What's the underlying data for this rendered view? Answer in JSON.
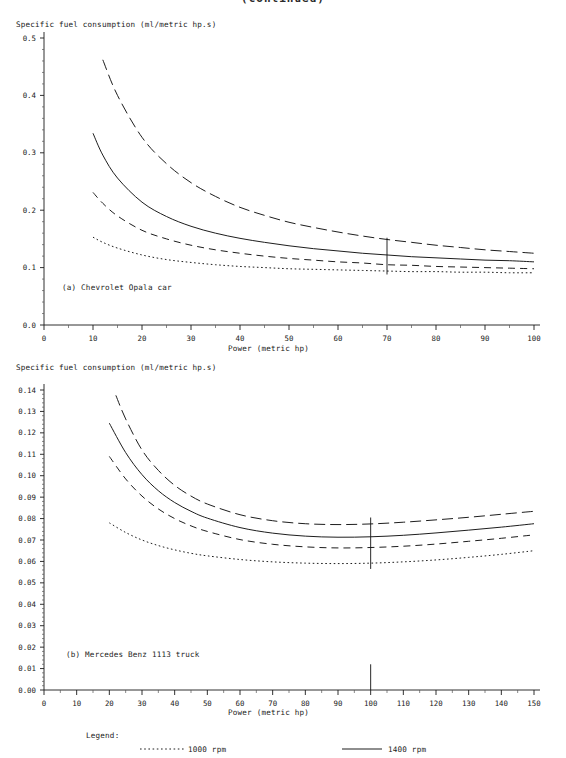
{
  "figure": {
    "top_title_clipped": "(continued)",
    "y_axis_title": "Specific fuel consumption (ml/metric hp.s)",
    "x_axis_title": "Power (metric hp)"
  },
  "legend": {
    "title": "Legend:",
    "entries": [
      {
        "label": "1000 rpm",
        "style": "dotted"
      },
      {
        "label": "1400 rpm",
        "style": "solid"
      }
    ]
  },
  "chart_data": [
    {
      "type": "line",
      "title": "(a) Chevrolet Opala car",
      "xlabel": "Power (metric hp)",
      "ylabel": "Specific fuel consumption (ml/metric hp.s)",
      "xlim": [
        0,
        100
      ],
      "ylim": [
        0.0,
        0.5
      ],
      "xticks": [
        0,
        10,
        20,
        30,
        40,
        50,
        60,
        70,
        80,
        90,
        100
      ],
      "yticks": [
        0.0,
        0.1,
        0.2,
        0.3,
        0.4,
        0.5
      ],
      "xtick_labels": [
        "0",
        "10",
        "20",
        "30",
        "40",
        "50",
        "60",
        "70",
        "80",
        "90",
        "100"
      ],
      "ytick_labels": [
        "0.0",
        "0.1",
        "0.2",
        "0.3",
        "0.4",
        "0.5"
      ],
      "minor_ticks": true,
      "grid": false,
      "legend_position": "below-figure",
      "marker_line_x": 70,
      "series": [
        {
          "name": "2400 rpm",
          "style": "long-dash",
          "x": [
            12,
            15,
            20,
            25,
            30,
            35,
            40,
            45,
            50,
            55,
            60,
            65,
            70,
            75,
            80,
            85,
            90,
            95,
            100
          ],
          "y": [
            0.462,
            0.4,
            0.327,
            0.281,
            0.248,
            0.224,
            0.205,
            0.191,
            0.179,
            0.17,
            0.162,
            0.155,
            0.149,
            0.144,
            0.139,
            0.135,
            0.131,
            0.128,
            0.125
          ]
        },
        {
          "name": "1400 rpm",
          "style": "solid",
          "x": [
            10,
            12,
            15,
            20,
            25,
            30,
            35,
            40,
            45,
            50,
            55,
            60,
            65,
            70,
            75,
            80,
            85,
            90,
            95,
            100
          ],
          "y": [
            0.334,
            0.296,
            0.256,
            0.214,
            0.189,
            0.172,
            0.16,
            0.151,
            0.144,
            0.138,
            0.133,
            0.129,
            0.125,
            0.122,
            0.119,
            0.117,
            0.115,
            0.113,
            0.112,
            0.11
          ]
        },
        {
          "name": "1800 rpm",
          "style": "medium-dash",
          "x": [
            10,
            12,
            15,
            20,
            25,
            30,
            35,
            40,
            45,
            50,
            55,
            60,
            65,
            70,
            75,
            80,
            85,
            90,
            95,
            100
          ],
          "y": [
            0.231,
            0.212,
            0.19,
            0.165,
            0.15,
            0.139,
            0.131,
            0.125,
            0.12,
            0.116,
            0.113,
            0.11,
            0.108,
            0.105,
            0.104,
            0.102,
            0.101,
            0.1,
            0.099,
            0.098
          ]
        },
        {
          "name": "1000 rpm",
          "style": "dotted",
          "x": [
            10,
            12,
            15,
            20,
            25,
            30,
            35,
            40,
            45,
            50,
            55,
            60,
            65,
            70,
            75,
            80,
            85,
            90,
            95,
            100
          ],
          "y": [
            0.153,
            0.144,
            0.134,
            0.122,
            0.114,
            0.109,
            0.105,
            0.102,
            0.1,
            0.098,
            0.097,
            0.096,
            0.095,
            0.094,
            0.093,
            0.093,
            0.092,
            0.092,
            0.091,
            0.091
          ]
        }
      ]
    },
    {
      "type": "line",
      "title": "(b) Mercedes Benz 1113 truck",
      "xlabel": "Power (metric hp)",
      "ylabel": "Specific fuel consumption (ml/metric hp.s)",
      "xlim": [
        0,
        150
      ],
      "ylim": [
        0.0,
        0.14
      ],
      "xticks": [
        0,
        10,
        20,
        30,
        40,
        50,
        60,
        70,
        80,
        90,
        100,
        110,
        120,
        130,
        140,
        150
      ],
      "yticks": [
        0.0,
        0.01,
        0.02,
        0.03,
        0.04,
        0.05,
        0.06,
        0.07,
        0.08,
        0.09,
        0.1,
        0.11,
        0.12,
        0.13,
        0.14
      ],
      "xtick_labels": [
        "0",
        "10",
        "20",
        "30",
        "40",
        "50",
        "60",
        "70",
        "80",
        "90",
        "100",
        "110",
        "120",
        "130",
        "140",
        "150"
      ],
      "ytick_labels": [
        "0.00",
        "0.01",
        "0.02",
        "0.03",
        "0.04",
        "0.05",
        "0.06",
        "0.07",
        "0.08",
        "0.09",
        "0.10",
        "0.11",
        "0.12",
        "0.13",
        "0.14"
      ],
      "minor_ticks": true,
      "grid": false,
      "legend_position": "below-figure",
      "marker_line_x": 100,
      "series": [
        {
          "name": "2400 rpm",
          "style": "long-dash",
          "x": [
            22,
            25,
            30,
            35,
            40,
            45,
            50,
            60,
            70,
            80,
            90,
            100,
            110,
            120,
            130,
            140,
            150
          ],
          "y": [
            0.1375,
            0.1265,
            0.112,
            0.1025,
            0.0955,
            0.0905,
            0.0868,
            0.0818,
            0.079,
            0.0776,
            0.0772,
            0.0775,
            0.0783,
            0.0794,
            0.0806,
            0.082,
            0.0834
          ]
        },
        {
          "name": "1400 rpm",
          "style": "solid",
          "x": [
            20,
            25,
            30,
            35,
            40,
            45,
            50,
            60,
            70,
            80,
            90,
            100,
            110,
            120,
            130,
            140,
            150
          ],
          "y": [
            0.1245,
            0.1108,
            0.1005,
            0.093,
            0.0875,
            0.0834,
            0.0802,
            0.0758,
            0.0732,
            0.0718,
            0.0713,
            0.0715,
            0.0722,
            0.0733,
            0.0746,
            0.076,
            0.0776
          ]
        },
        {
          "name": "1800 rpm",
          "style": "medium-dash",
          "x": [
            20,
            25,
            30,
            35,
            40,
            45,
            50,
            60,
            70,
            80,
            90,
            100,
            110,
            120,
            130,
            140,
            150
          ],
          "y": [
            0.109,
            0.0985,
            0.0905,
            0.0845,
            0.08,
            0.0766,
            0.074,
            0.0702,
            0.068,
            0.0668,
            0.0663,
            0.0665,
            0.0671,
            0.0681,
            0.0694,
            0.0708,
            0.0724
          ]
        },
        {
          "name": "1000 rpm",
          "style": "dotted",
          "x": [
            20,
            25,
            30,
            35,
            40,
            45,
            50,
            60,
            70,
            80,
            90,
            100,
            110,
            120,
            130,
            140,
            150
          ],
          "y": [
            0.078,
            0.0735,
            0.07,
            0.0674,
            0.0654,
            0.0638,
            0.0626,
            0.0609,
            0.0598,
            0.0592,
            0.059,
            0.0592,
            0.0598,
            0.0607,
            0.0619,
            0.0633,
            0.065
          ]
        }
      ]
    }
  ]
}
